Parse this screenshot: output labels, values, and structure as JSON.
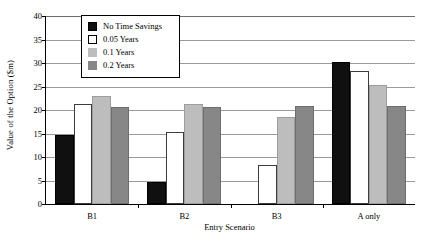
{
  "chart_data": {
    "type": "bar",
    "title": "",
    "xlabel": "Entry Scenario",
    "ylabel": "Value of the Option ($m)",
    "categories": [
      "B1",
      "B2",
      "B3",
      "A only"
    ],
    "series": [
      {
        "name": "No Time Savings",
        "color": "#101010",
        "values": [
          14.7,
          4.7,
          0.0,
          30.3
        ]
      },
      {
        "name": "0.05 Years",
        "color": "#ffffff",
        "values": [
          21.3,
          15.3,
          8.4,
          28.2
        ]
      },
      {
        "name": "0.1 Years",
        "color": "#bdbdbd",
        "values": [
          23.0,
          21.2,
          18.6,
          25.4
        ]
      },
      {
        "name": "0.2 Years",
        "color": "#878787",
        "values": [
          20.7,
          20.7,
          20.8,
          20.8
        ]
      }
    ],
    "ylim": [
      0,
      40
    ],
    "yticks": [
      0,
      5,
      10,
      15,
      20,
      25,
      30,
      35,
      40
    ],
    "ytick_labels": [
      "0",
      "5",
      "10",
      "15",
      "20",
      "25",
      "30",
      "35",
      "40"
    ],
    "grid": true,
    "legend_position": "upper-left-inside"
  }
}
